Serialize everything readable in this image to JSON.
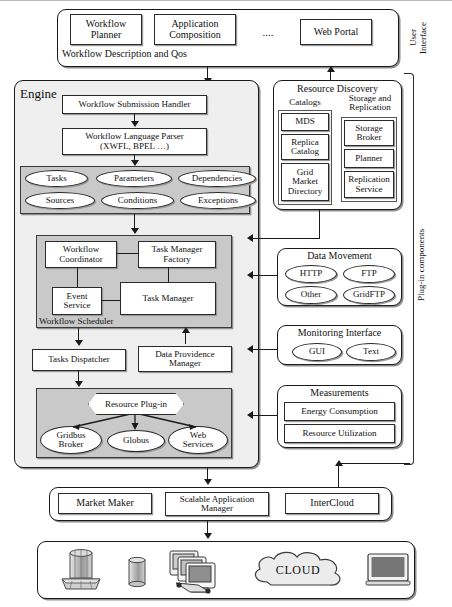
{
  "diagram": {
    "side_labels": {
      "user_interface": "User\nInterface",
      "plugin_components": "Plug-in components"
    }
  },
  "user_interface": {
    "footer_label": "Workflow Description and Qos",
    "items": [
      {
        "label": "Workflow\nPlanner"
      },
      {
        "label": "Application\nComposition"
      },
      {
        "label": "...."
      },
      {
        "label": "Web Portal"
      }
    ]
  },
  "engine": {
    "title": "Engine",
    "submission_handler": "Workflow Submission Handler",
    "language_parser": "Workflow Language Parser\n(XWFL, BPEL …)",
    "elements_group": [
      "Tasks",
      "Parameters",
      "Dependencies",
      "Sources",
      "Conditions",
      "Exceptions"
    ],
    "scheduler": {
      "label": "Workflow Scheduler",
      "coordinator": "Workflow\nCoordinator",
      "task_manager_factory": "Task Manager\nFactory",
      "event_service": "Event\nService",
      "task_manager": "Task Manager"
    },
    "tasks_dispatcher": "Tasks Dispatcher",
    "data_providence_manager": "Data Providence\nManager",
    "resource_plugin": {
      "label": "Resource Plug-in",
      "providers": [
        "Gridbus\nBroker",
        "Globus",
        "Web\nServices"
      ]
    }
  },
  "resource_discovery": {
    "title": "Resource Discovery",
    "catalogs": {
      "title": "Catalogs",
      "items": [
        "MDS",
        "Replica\nCatalog",
        "Grid\nMarket\nDirectory"
      ]
    },
    "storage_replication": {
      "title": "Storage and\nReplication",
      "items": [
        "Storage\nBroker",
        "Planner",
        "Replication\nService"
      ]
    }
  },
  "data_movement": {
    "title": "Data Movement",
    "items": [
      "HTTP",
      "FTP",
      "Other",
      "GridFTP"
    ]
  },
  "monitoring_interface": {
    "title": "Monitoring Interface",
    "items": [
      "GUI",
      "Text"
    ]
  },
  "measurements": {
    "title": "Measurements",
    "items": [
      "Energy Consumption",
      "Resource Utilization"
    ]
  },
  "middleware": {
    "items": [
      "Market Maker",
      "Scalable Application\nManager",
      "InterCloud"
    ]
  },
  "infrastructure": {
    "cloud_label": "CLOUD",
    "icons": [
      "cluster-icon",
      "storage-cylinder-icon",
      "computer-stack-icon",
      "cloud-icon",
      "monitor-icon"
    ]
  }
}
